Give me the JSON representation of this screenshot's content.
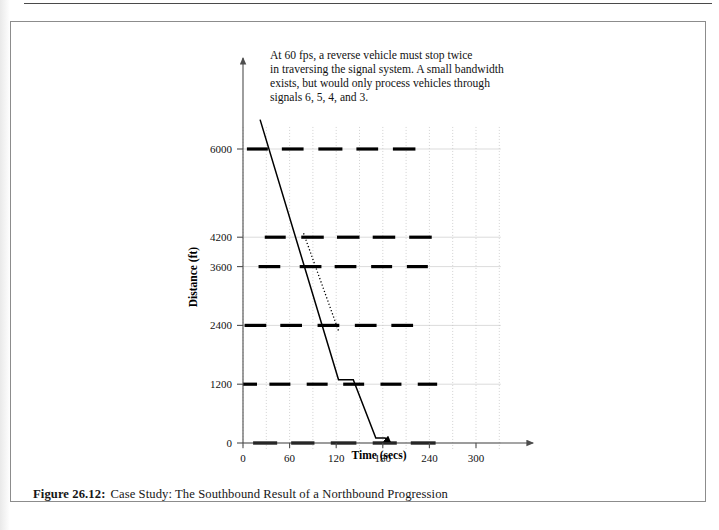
{
  "figure": {
    "caption_label": "Figure 26.12:",
    "caption_text": "Case Study: The Southbound Result of a Northbound Progression"
  },
  "annotation": {
    "line1": "At 60 fps, a reverse vehicle must stop twice",
    "line2": "in traversing the signal system. A small bandwidth",
    "line3": "exists, but would only process vehicles through",
    "line4": "signals 6, 5, 4, and 3."
  },
  "chart_data": {
    "type": "line",
    "title": "",
    "xlabel": "Time (secs)",
    "ylabel": "Distance (ft)",
    "xlim": [
      0,
      330
    ],
    "ylim": [
      0,
      6600
    ],
    "xticks": [
      0,
      60,
      120,
      180,
      240,
      300
    ],
    "xtick_labels": [
      "0",
      "60",
      "120",
      "180",
      "240",
      "300"
    ],
    "yticks": [
      0,
      1200,
      2400,
      3600,
      4200,
      6000
    ],
    "ytick_labels": [
      "0",
      "1200",
      "2400",
      "3600",
      "4200",
      "6000"
    ],
    "grid": true,
    "grid_v_step": 30,
    "legend": "none",
    "series": [
      {
        "name": "reverse-vehicle-trajectory",
        "style": "solid",
        "points": [
          [
            22,
            6600
          ],
          [
            123,
            1290
          ],
          [
            133,
            1290
          ],
          [
            142,
            1290
          ],
          [
            171,
            100
          ],
          [
            183,
            100
          ],
          [
            190,
            0
          ]
        ],
        "arrow_at_end": true
      },
      {
        "name": "bandwidth-indicator",
        "style": "dotted",
        "points": [
          [
            78,
            4280
          ],
          [
            123,
            2290
          ]
        ],
        "arrow_at_end": false
      }
    ],
    "signal_green_bands": [
      {
        "signal": "7",
        "distance": 6000,
        "intervals": [
          [
            5,
            32
          ],
          [
            50,
            78
          ],
          [
            97,
            128
          ],
          [
            146,
            174
          ],
          [
            193,
            222
          ]
        ]
      },
      {
        "signal": "6",
        "distance": 4200,
        "intervals": [
          [
            28,
            55
          ],
          [
            75,
            104
          ],
          [
            121,
            150
          ],
          [
            167,
            196
          ],
          [
            214,
            243
          ]
        ]
      },
      {
        "signal": "5",
        "distance": 3600,
        "intervals": [
          [
            20,
            48
          ],
          [
            73,
            101
          ],
          [
            118,
            146
          ],
          [
            165,
            192
          ],
          [
            211,
            238
          ]
        ]
      },
      {
        "signal": "4",
        "distance": 2400,
        "intervals": [
          [
            2,
            30
          ],
          [
            48,
            76
          ],
          [
            96,
            124
          ],
          [
            144,
            172
          ],
          [
            191,
            219
          ]
        ]
      },
      {
        "signal": "3",
        "distance": 1200,
        "intervals": [
          [
            0,
            18
          ],
          [
            34,
            61
          ],
          [
            82,
            109
          ],
          [
            129,
            156
          ],
          [
            177,
            204
          ],
          [
            225,
            250
          ]
        ]
      },
      {
        "signal": "2",
        "distance": 0,
        "intervals": [
          [
            13,
            44
          ],
          [
            62,
            92
          ],
          [
            113,
            146
          ],
          [
            167,
            198
          ],
          [
            216,
            248
          ]
        ]
      }
    ]
  }
}
